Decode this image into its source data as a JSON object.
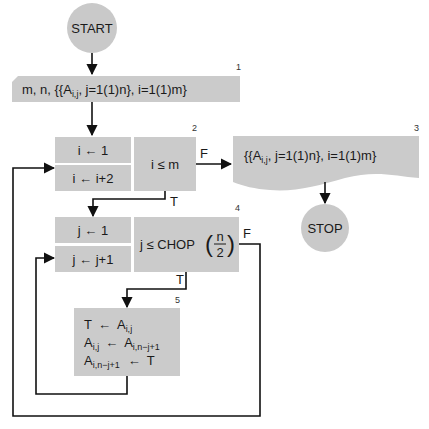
{
  "diagram": {
    "type": "flowchart",
    "colors": {
      "shape_fill": "#cbcbcb",
      "line": "#111111",
      "background": "#ffffff"
    },
    "nodes": {
      "start": {
        "label": "START"
      },
      "input": {
        "number": "1",
        "text_prefix": "m,  n,  {{A",
        "sub": "i,j",
        "text_suffix": ",  j=1(1)n},  i=1(1)m}"
      },
      "loop_i": {
        "number": "2",
        "init": "i ← 1",
        "increment": "i ← i+2",
        "condition": "i  ≤  m",
        "false_label": "F",
        "true_label": "T"
      },
      "output": {
        "number": "3",
        "text_prefix": "{{A",
        "sub": "i,j",
        "text_suffix": ",  j=1(1)n},  i=1(1)m}"
      },
      "stop": {
        "label": "STOP"
      },
      "loop_j": {
        "number": "4",
        "init": "j ← 1",
        "increment": "j ← j+1",
        "condition_prefix": "j  ≤  CHOP",
        "frac_num": "n",
        "frac_den": "2",
        "false_label": "F",
        "true_label": "T"
      },
      "swap": {
        "number": "5",
        "lines": [
          {
            "lhs": "T",
            "lhs_sub": "",
            "arrow": "←",
            "rhs": "A",
            "rhs_sub": "i,j"
          },
          {
            "lhs": "A",
            "lhs_sub": "i,j",
            "arrow": "←",
            "rhs": "A",
            "rhs_sub": "i,n−j+1"
          },
          {
            "lhs": "A",
            "lhs_sub": "i,n−j+1",
            "arrow": "←",
            "rhs": "T",
            "rhs_sub": ""
          }
        ]
      }
    }
  }
}
